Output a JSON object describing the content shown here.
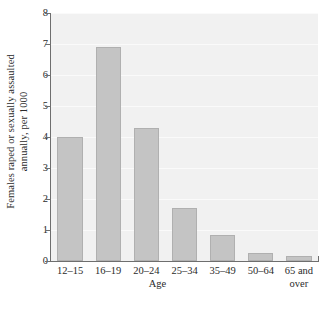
{
  "chart_data": {
    "type": "bar",
    "title": "",
    "xlabel": "Age",
    "ylabel": "Females raped or sexually assaulted annually, per 1000",
    "ylabel_line1": "Females raped or sexually assaulted",
    "ylabel_line2": "annually, per 1000",
    "categories": [
      "12–15",
      "16–19",
      "20–24",
      "25–34",
      "35–49",
      "50–64",
      "65 and over"
    ],
    "category_lines": [
      [
        "12–15"
      ],
      [
        "16–19"
      ],
      [
        "20–24"
      ],
      [
        "25–34"
      ],
      [
        "35–49"
      ],
      [
        "50–64"
      ],
      [
        "65 and",
        "over"
      ]
    ],
    "values": [
      4.0,
      6.9,
      4.3,
      1.7,
      0.85,
      0.25,
      0.15
    ],
    "ylim": [
      0,
      8
    ],
    "yticks": [
      0,
      1,
      2,
      3,
      4,
      5,
      6,
      7,
      8
    ],
    "ytick_labels": [
      "0",
      "1",
      "2",
      "3",
      "4",
      "5",
      "6",
      "7",
      "8"
    ],
    "grid": true,
    "grid_axis": "y",
    "legend": "none",
    "colors": {
      "bar_fill": "#c4c4c4",
      "bar_stroke": "#b0b0b0",
      "plot_background": "#f1f1f1",
      "gridline": "#fafafa",
      "axis": "#6e6e6e",
      "text": "#2b2b2b",
      "figure_background": "#ffffff"
    }
  }
}
